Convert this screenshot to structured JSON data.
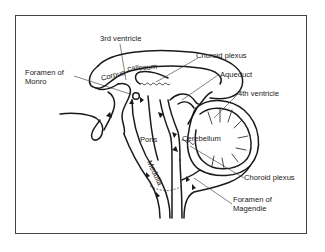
{
  "diagram": {
    "labels": {
      "third_ventricle": "3rd ventricle",
      "foramen_of_monro_line1": "Foramen of",
      "foramen_of_monro_line2": "Monro",
      "corpus_callosum_1": "Corpus",
      "corpus_callosum_2": "callosum",
      "choroid_plexus_upper": "Choroid plexus",
      "aqueduct": "Aqueduct",
      "fourth_ventricle": "4th ventricle",
      "cerebellum": "Cerebellum",
      "pons": "Pons",
      "medulla": "Medulla",
      "choroid_plexus_lower": "Choroid plexus",
      "foramen_of_magendie_line1": "Foramen of",
      "foramen_of_magendie_line2": "Magendie"
    },
    "colors": {
      "line": "#1a1a1a",
      "text": "#222222",
      "background": "#ffffff",
      "frame": "#444444"
    }
  }
}
